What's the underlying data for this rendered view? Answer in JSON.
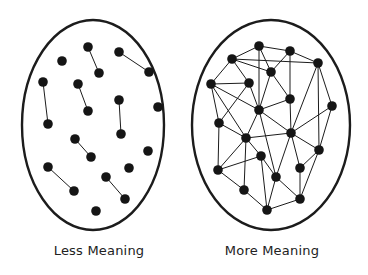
{
  "colors": {
    "stroke": "#1c1c1c",
    "node": "#151515",
    "background": "#ffffff"
  },
  "left_panel": {
    "label": "Less Meaning",
    "ellipse": {
      "cx": 93,
      "cy": 125,
      "rx": 71,
      "ry": 105
    },
    "nodes": [
      [
        88,
        47
      ],
      [
        99,
        73
      ],
      [
        62,
        61
      ],
      [
        119,
        52
      ],
      [
        149,
        72
      ],
      [
        43,
        82
      ],
      [
        48,
        124
      ],
      [
        78,
        84
      ],
      [
        88,
        111
      ],
      [
        119,
        100
      ],
      [
        121,
        134
      ],
      [
        158,
        107
      ],
      [
        75,
        139
      ],
      [
        91,
        157
      ],
      [
        148,
        151
      ],
      [
        48,
        167
      ],
      [
        74,
        191
      ],
      [
        129,
        168
      ],
      [
        106,
        177
      ],
      [
        125,
        199
      ],
      [
        96,
        211
      ]
    ],
    "edges": [
      [
        0,
        1
      ],
      [
        3,
        4
      ],
      [
        5,
        6
      ],
      [
        7,
        8
      ],
      [
        9,
        10
      ],
      [
        12,
        13
      ],
      [
        15,
        16
      ],
      [
        18,
        19
      ]
    ]
  },
  "right_panel": {
    "label": "More Meaning",
    "ellipse": {
      "cx": 271,
      "cy": 125,
      "rx": 79,
      "ry": 105
    },
    "nodes": [
      [
        259,
        46
      ],
      [
        290,
        51
      ],
      [
        232,
        59
      ],
      [
        271,
        72
      ],
      [
        318,
        63
      ],
      [
        211,
        84
      ],
      [
        249,
        83
      ],
      [
        290,
        99
      ],
      [
        259,
        110
      ],
      [
        332,
        106
      ],
      [
        219,
        123
      ],
      [
        291,
        133
      ],
      [
        246,
        138
      ],
      [
        319,
        150
      ],
      [
        261,
        156
      ],
      [
        218,
        170
      ],
      [
        300,
        168
      ],
      [
        276,
        177
      ],
      [
        244,
        190
      ],
      [
        300,
        199
      ],
      [
        267,
        210
      ]
    ],
    "edges": [
      [
        0,
        1
      ],
      [
        0,
        2
      ],
      [
        0,
        3
      ],
      [
        0,
        8
      ],
      [
        1,
        3
      ],
      [
        1,
        4
      ],
      [
        1,
        7
      ],
      [
        2,
        4
      ],
      [
        2,
        5
      ],
      [
        2,
        6
      ],
      [
        2,
        3
      ],
      [
        3,
        7
      ],
      [
        3,
        8
      ],
      [
        4,
        9
      ],
      [
        4,
        11
      ],
      [
        4,
        13
      ],
      [
        5,
        6
      ],
      [
        5,
        8
      ],
      [
        5,
        10
      ],
      [
        5,
        12
      ],
      [
        6,
        8
      ],
      [
        6,
        10
      ],
      [
        7,
        8
      ],
      [
        7,
        11
      ],
      [
        8,
        12
      ],
      [
        8,
        11
      ],
      [
        8,
        17
      ],
      [
        9,
        11
      ],
      [
        9,
        13
      ],
      [
        10,
        12
      ],
      [
        10,
        15
      ],
      [
        11,
        12
      ],
      [
        11,
        13
      ],
      [
        11,
        16
      ],
      [
        11,
        17
      ],
      [
        12,
        14
      ],
      [
        12,
        18
      ],
      [
        12,
        15
      ],
      [
        13,
        16
      ],
      [
        13,
        19
      ],
      [
        14,
        15
      ],
      [
        14,
        20
      ],
      [
        15,
        18
      ],
      [
        16,
        19
      ],
      [
        17,
        19
      ],
      [
        17,
        20
      ],
      [
        18,
        20
      ],
      [
        19,
        20
      ],
      [
        14,
        17
      ]
    ]
  }
}
